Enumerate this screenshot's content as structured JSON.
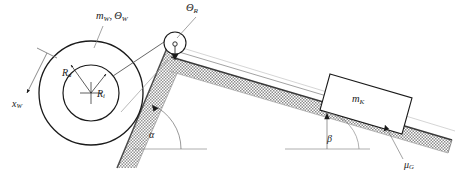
{
  "diagram": {
    "background_color": "#ffffff",
    "line_color": "#1a1a1a",
    "hatch_fill": "#b4b4b4",
    "ground_line_color": "#9a9a9a"
  },
  "labels": {
    "wheel_mass_inertia": {
      "symbol": "m",
      "subscript": "W",
      "symbol2": "Θ",
      "subscript2": "W",
      "text": "m_W, Θ_W"
    },
    "pulley_inertia": {
      "symbol": "Θ",
      "subscript": "R",
      "text": "Θ_R"
    },
    "outer_radius": {
      "symbol": "R",
      "subscript": "a",
      "text": "R_a"
    },
    "inner_radius": {
      "symbol": "R",
      "subscript": "i",
      "text": "R_i"
    },
    "wheel_axis": {
      "symbol": "x",
      "subscript": "W",
      "text": "x_W"
    },
    "angle_left": {
      "symbol": "α",
      "text": "α"
    },
    "angle_right": {
      "symbol": "β",
      "text": "β"
    },
    "block_mass": {
      "symbol": "m",
      "subscript": "K",
      "text": "m_K"
    },
    "friction_coeff": {
      "symbol": "μ",
      "subscript": "G",
      "text": "μ_G"
    }
  },
  "components": {
    "wheel": {
      "name": "wheel",
      "outer_radius_px": 52,
      "inner_radius_px": 28,
      "center_x": 91,
      "center_y": 93
    },
    "pulley": {
      "name": "pulley",
      "radius_px": 11,
      "center_x": 175,
      "center_y": 43
    },
    "block": {
      "name": "block",
      "label": "m_K"
    },
    "left_incline": {
      "name": "left-incline",
      "angle_label": "α"
    },
    "right_incline": {
      "name": "right-incline",
      "angle_label": "β",
      "friction_label": "μ_G"
    },
    "rope": {
      "name": "rope"
    }
  }
}
